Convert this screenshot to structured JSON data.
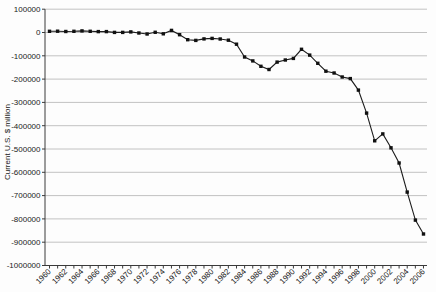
{
  "chart_data": {
    "type": "line",
    "title": "",
    "xlabel": "",
    "ylabel": "Current U.S. $ million",
    "legend": "none",
    "grid": "horizontal",
    "ylim": [
      -1000000,
      100000
    ],
    "y_ticks": [
      100000,
      0,
      -100000,
      -200000,
      -300000,
      -400000,
      -500000,
      -600000,
      -700000,
      -800000,
      -900000,
      -1000000
    ],
    "x_tick_labels": [
      "1960",
      "1962",
      "1964",
      "1966",
      "1968",
      "1970",
      "1972",
      "1974",
      "1976",
      "1978",
      "1980",
      "1982",
      "1984",
      "1986",
      "1988",
      "1990",
      "1992",
      "1994",
      "1996",
      "1998",
      "2000",
      "2002",
      "2004",
      "2006"
    ],
    "x": [
      1960,
      1961,
      1962,
      1963,
      1964,
      1965,
      1966,
      1967,
      1968,
      1969,
      1970,
      1971,
      1972,
      1973,
      1974,
      1975,
      1976,
      1977,
      1978,
      1979,
      1980,
      1981,
      1982,
      1983,
      1984,
      1985,
      1986,
      1987,
      1988,
      1989,
      1990,
      1991,
      1992,
      1993,
      1994,
      1995,
      1996,
      1997,
      1998,
      1999,
      2000,
      2001,
      2002,
      2003,
      2004,
      2005,
      2006
    ],
    "values": [
      5000,
      5600,
      4500,
      5200,
      6800,
      5000,
      3800,
      3800,
      600,
      600,
      2600,
      -2300,
      -6400,
      900,
      -5500,
      8900,
      -9500,
      -31000,
      -34000,
      -27500,
      -25500,
      -28000,
      -33000,
      -50000,
      -105000,
      -122000,
      -145000,
      -159000,
      -127000,
      -118000,
      -111000,
      -72000,
      -97000,
      -132000,
      -166000,
      -174000,
      -191000,
      -198000,
      -247000,
      -346000,
      -465000,
      -435000,
      -495000,
      -560000,
      -685000,
      -805000,
      -865000
    ],
    "colors": {
      "line": "#1c1c1c",
      "marker": "#111111",
      "grid": "#c2c2c2",
      "axis": "#3a3a3a",
      "text": "#1a1a1a",
      "background": "#fdfdfd"
    },
    "marker_shape": "square"
  }
}
